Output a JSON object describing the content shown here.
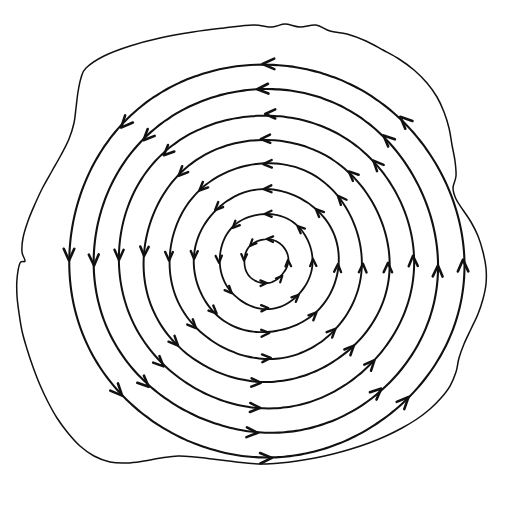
{
  "figure": {
    "title": "Rotational vector field on an irregular planar region",
    "background_color": "#ffffff",
    "ink_color": "#111111",
    "canvas": {
      "width": 521,
      "height": 506
    }
  },
  "chart_data": {
    "type": "scatter",
    "title": "Rotational vector field on an irregular planar region",
    "subtitle": "",
    "xlabel": "",
    "ylabel": "",
    "xlim": [
      0,
      521
    ],
    "ylim": [
      0,
      506
    ],
    "grid": false,
    "legend": "none",
    "annotations": [],
    "field": {
      "kind": "solenoidal-circulation",
      "orientation": "counterclockwise",
      "center": {
        "x": 266,
        "y": 261
      },
      "cardinal_arrow_directions": {
        "top": "left",
        "left": "down",
        "bottom": "right",
        "right": "up"
      },
      "streamline_count": 8,
      "streamline_radii": [
        22,
        47,
        72,
        97,
        122,
        147,
        172,
        197
      ],
      "arrow_angles_deg": [
        0,
        45,
        90,
        135,
        180,
        225,
        270,
        315
      ],
      "stroke_widths": [
        1.7,
        1.8,
        1.9,
        1.9,
        2.0,
        2.0,
        2.1,
        2.1
      ]
    },
    "boundary": {
      "kind": "closed-irregular-blob",
      "stroke_width": 1.5,
      "points": [
        [
          86,
          68
        ],
        [
          104,
          56
        ],
        [
          130,
          46
        ],
        [
          160,
          38
        ],
        [
          193,
          32
        ],
        [
          224,
          28
        ],
        [
          253,
          25
        ],
        [
          272,
          27
        ],
        [
          285,
          24
        ],
        [
          300,
          27
        ],
        [
          316,
          25
        ],
        [
          330,
          31
        ],
        [
          347,
          34
        ],
        [
          366,
          41
        ],
        [
          383,
          50
        ],
        [
          399,
          59
        ],
        [
          414,
          70
        ],
        [
          427,
          83
        ],
        [
          437,
          97
        ],
        [
          444,
          112
        ],
        [
          449,
          128
        ],
        [
          452,
          145
        ],
        [
          455,
          161
        ],
        [
          456,
          176
        ],
        [
          453,
          188
        ],
        [
          456,
          199
        ],
        [
          463,
          210
        ],
        [
          471,
          222
        ],
        [
          478,
          236
        ],
        [
          483,
          252
        ],
        [
          486,
          268
        ],
        [
          486,
          284
        ],
        [
          483,
          299
        ],
        [
          478,
          314
        ],
        [
          471,
          329
        ],
        [
          464,
          344
        ],
        [
          459,
          358
        ],
        [
          456,
          372
        ],
        [
          450,
          386
        ],
        [
          441,
          398
        ],
        [
          430,
          409
        ],
        [
          417,
          419
        ],
        [
          402,
          428
        ],
        [
          386,
          436
        ],
        [
          369,
          443
        ],
        [
          351,
          449
        ],
        [
          333,
          454
        ],
        [
          315,
          458
        ],
        [
          297,
          461
        ],
        [
          280,
          463
        ],
        [
          263,
          464
        ],
        [
          246,
          463
        ],
        [
          229,
          461
        ],
        [
          212,
          459
        ],
        [
          195,
          457
        ],
        [
          178,
          456
        ],
        [
          161,
          458
        ],
        [
          144,
          461
        ],
        [
          127,
          463
        ],
        [
          110,
          462
        ],
        [
          94,
          456
        ],
        [
          80,
          446
        ],
        [
          68,
          433
        ],
        [
          57,
          418
        ],
        [
          48,
          402
        ],
        [
          40,
          385
        ],
        [
          33,
          367
        ],
        [
          27,
          349
        ],
        [
          22,
          331
        ],
        [
          19,
          313
        ],
        [
          17,
          296
        ],
        [
          17,
          279
        ],
        [
          20,
          263
        ],
        [
          25,
          261
        ],
        [
          22,
          252
        ],
        [
          23,
          238
        ],
        [
          28,
          221
        ],
        [
          35,
          204
        ],
        [
          43,
          187
        ],
        [
          52,
          171
        ],
        [
          61,
          155
        ],
        [
          69,
          139
        ],
        [
          74,
          123
        ],
        [
          76,
          108
        ],
        [
          78,
          92
        ],
        [
          81,
          78
        ]
      ]
    }
  },
  "elements": {
    "region_name": "region-boundary",
    "field_group_name": "vector-field-streamlines"
  }
}
